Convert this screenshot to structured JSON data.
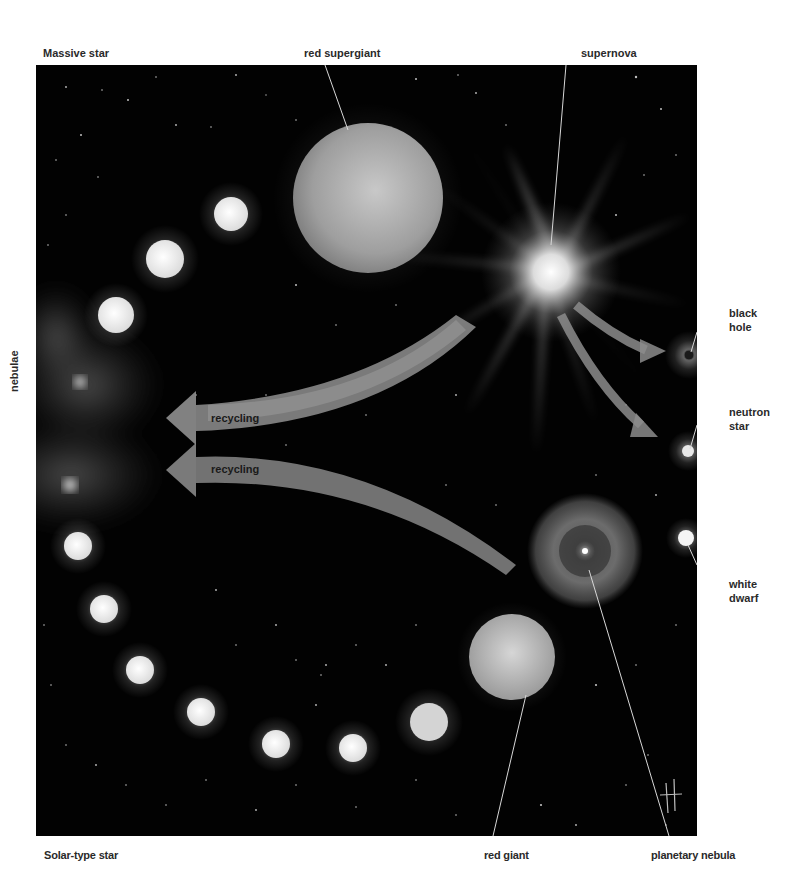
{
  "labels": {
    "massive_star": "Massive star",
    "red_supergiant": "red supergiant",
    "supernova": "supernova",
    "black_hole": "black\nhole",
    "neutron_star": "neutron\nstar",
    "white_dwarf": "white\ndwarf",
    "nebulae": "nebulae",
    "solar_type_star": "Solar-type star",
    "red_giant": "red giant",
    "planetary_nebula": "planetary nebula"
  },
  "arrows": [
    {
      "id": "recycling-upper",
      "label": "recycling"
    },
    {
      "id": "recycling-lower",
      "label": "recycling"
    }
  ],
  "colors": {
    "background": "#ffffff",
    "space": "#020202",
    "star_white": "#f2f2f2",
    "arrow_gray": "#9a9a9a",
    "leader_line": "#d8d8d8",
    "label_text": "#2a2a2a"
  },
  "massive_sequence": [
    {
      "cx": 195,
      "cy": 149,
      "r": 17
    },
    {
      "cx": 129,
      "cy": 194,
      "r": 19
    },
    {
      "cx": 80,
      "cy": 250,
      "r": 18
    }
  ],
  "solar_sequence": [
    {
      "cx": 42,
      "cy": 481,
      "r": 14
    },
    {
      "cx": 68,
      "cy": 544,
      "r": 14
    },
    {
      "cx": 104,
      "cy": 605,
      "r": 14
    },
    {
      "cx": 165,
      "cy": 647,
      "r": 14
    },
    {
      "cx": 240,
      "cy": 679,
      "r": 14
    },
    {
      "cx": 317,
      "cy": 683,
      "r": 14
    },
    {
      "cx": 393,
      "cy": 657,
      "r": 19
    }
  ],
  "objects": {
    "red_supergiant": {
      "cx": 332,
      "cy": 133,
      "r": 75
    },
    "supernova": {
      "cx": 515,
      "cy": 207
    },
    "black_hole": {
      "cx": 653,
      "cy": 290,
      "r": 5
    },
    "neutron_star": {
      "cx": 652,
      "cy": 386,
      "r": 6
    },
    "white_dwarf": {
      "cx": 650,
      "cy": 473,
      "r": 9
    },
    "planetary_nebula": {
      "cx": 549,
      "cy": 486,
      "r": 58
    },
    "red_giant": {
      "cx": 476,
      "cy": 592,
      "r": 43
    }
  },
  "signature": "H"
}
